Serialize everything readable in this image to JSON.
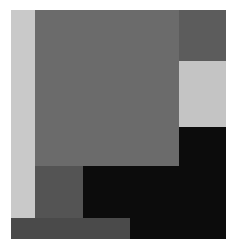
{
  "artwork": {
    "description": "Abstract geometric composition of gray, light gray and black rectangles",
    "colors": {
      "light_strip": "#c9c9c9",
      "large_square": "#6b6b6b",
      "top_right_block": "#5c5c5c",
      "right_light_block": "#c4c4c4",
      "black_area": "#0c0c0c",
      "bottom_left_block": "#545454",
      "bottom_strip": "#4a4a4a"
    }
  }
}
